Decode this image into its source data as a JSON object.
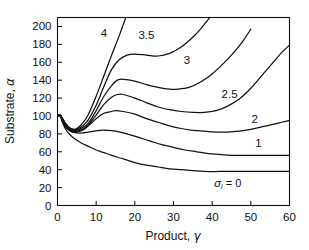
{
  "chart_data": {
    "type": "line",
    "title": "",
    "xlabel": "Product, γ",
    "ylabel": "Substrate, α",
    "xlim": [
      0,
      60
    ],
    "ylim": [
      0,
      210
    ],
    "xticks": [
      0,
      10,
      20,
      30,
      40,
      50,
      60
    ],
    "yticks": [
      0,
      20,
      40,
      60,
      80,
      100,
      120,
      140,
      160,
      180,
      200
    ],
    "grid": false,
    "legend": "inline-curve-labels",
    "annotations": [
      {
        "text": "σᵢ = 0",
        "x": 44,
        "y": 25,
        "note": "label for lowest curve"
      }
    ],
    "series": [
      {
        "name": "4",
        "label": "4",
        "label_x": 12,
        "label_y": 193,
        "points": [
          [
            0,
            100
          ],
          [
            0.6,
            101
          ],
          [
            1.2,
            98
          ],
          [
            2,
            92
          ],
          [
            3,
            87
          ],
          [
            4,
            85
          ],
          [
            5,
            86
          ],
          [
            6.5,
            92
          ],
          [
            8,
            102
          ],
          [
            10,
            122
          ],
          [
            12,
            145
          ],
          [
            14,
            168
          ],
          [
            16,
            190
          ],
          [
            17.5,
            208
          ],
          [
            18,
            212
          ]
        ]
      },
      {
        "name": "3.5",
        "label": "3.5",
        "label_x": 23,
        "label_y": 190,
        "points": [
          [
            0,
            100
          ],
          [
            0.6,
            101
          ],
          [
            1.2,
            98
          ],
          [
            2,
            92
          ],
          [
            3,
            87
          ],
          [
            4,
            85
          ],
          [
            5,
            85
          ],
          [
            6.5,
            89
          ],
          [
            8,
            96
          ],
          [
            10,
            112
          ],
          [
            12,
            133
          ],
          [
            14,
            152
          ],
          [
            16,
            163
          ],
          [
            18,
            168
          ],
          [
            20,
            169
          ],
          [
            23,
            168
          ],
          [
            26,
            167
          ],
          [
            29,
            170
          ],
          [
            32,
            177
          ],
          [
            35,
            188
          ],
          [
            37,
            197
          ],
          [
            39,
            208
          ],
          [
            39.8,
            212
          ]
        ]
      },
      {
        "name": "3",
        "label": "3",
        "label_x": 33.5,
        "label_y": 163,
        "points": [
          [
            0,
            100
          ],
          [
            0.6,
            101
          ],
          [
            1.2,
            97
          ],
          [
            2,
            91
          ],
          [
            3,
            86
          ],
          [
            4,
            84
          ],
          [
            5,
            84
          ],
          [
            6.5,
            87
          ],
          [
            8,
            92
          ],
          [
            10,
            106
          ],
          [
            12,
            122
          ],
          [
            14,
            134
          ],
          [
            15.5,
            140
          ],
          [
            17,
            141
          ],
          [
            20,
            139
          ],
          [
            23,
            135
          ],
          [
            26,
            132
          ],
          [
            29,
            130
          ],
          [
            31,
            130
          ],
          [
            34,
            132
          ],
          [
            37,
            138
          ],
          [
            40,
            147
          ],
          [
            43,
            159
          ],
          [
            46,
            173
          ],
          [
            48,
            184
          ],
          [
            50,
            197
          ]
        ]
      },
      {
        "name": "2.5",
        "label": "2.5",
        "label_x": 44.5,
        "label_y": 124,
        "points": [
          [
            0,
            100
          ],
          [
            0.6,
            101
          ],
          [
            1.2,
            97
          ],
          [
            2,
            90
          ],
          [
            3,
            85
          ],
          [
            4,
            83
          ],
          [
            5,
            83
          ],
          [
            6.5,
            85
          ],
          [
            8,
            90
          ],
          [
            10,
            101
          ],
          [
            12,
            113
          ],
          [
            14,
            121
          ],
          [
            15.5,
            124
          ],
          [
            17,
            124
          ],
          [
            20,
            120
          ],
          [
            23,
            115
          ],
          [
            26,
            110
          ],
          [
            29,
            107
          ],
          [
            32,
            105
          ],
          [
            35,
            104
          ],
          [
            38,
            104
          ],
          [
            41,
            106
          ],
          [
            44,
            111
          ],
          [
            47,
            119
          ],
          [
            50,
            131
          ],
          [
            53,
            146
          ],
          [
            56,
            161
          ],
          [
            58,
            171
          ],
          [
            60,
            179
          ]
        ]
      },
      {
        "name": "2",
        "label": "2",
        "label_x": 51,
        "label_y": 97,
        "points": [
          [
            0,
            100
          ],
          [
            0.6,
            101
          ],
          [
            1.2,
            96
          ],
          [
            2,
            89
          ],
          [
            3,
            84
          ],
          [
            4,
            82
          ],
          [
            5,
            82
          ],
          [
            6.5,
            84
          ],
          [
            8,
            89
          ],
          [
            10,
            97
          ],
          [
            12,
            103
          ],
          [
            14,
            105
          ],
          [
            15,
            106
          ],
          [
            17,
            105
          ],
          [
            20,
            102
          ],
          [
            23,
            97
          ],
          [
            26,
            93
          ],
          [
            29,
            89
          ],
          [
            32,
            86
          ],
          [
            35,
            84
          ],
          [
            38,
            83
          ],
          [
            41,
            82
          ],
          [
            44,
            82
          ],
          [
            47,
            83
          ],
          [
            50,
            85
          ],
          [
            53,
            88
          ],
          [
            56,
            91
          ],
          [
            58,
            93
          ],
          [
            60,
            95
          ]
        ]
      },
      {
        "name": "1",
        "label": "1",
        "label_x": 52,
        "label_y": 70,
        "points": [
          [
            0,
            100
          ],
          [
            0.6,
            101
          ],
          [
            1.2,
            95
          ],
          [
            2,
            88
          ],
          [
            3,
            84
          ],
          [
            4,
            82
          ],
          [
            5,
            81
          ],
          [
            6.5,
            81
          ],
          [
            8,
            82
          ],
          [
            9.5,
            83
          ],
          [
            11,
            84
          ],
          [
            13,
            84
          ],
          [
            15,
            83
          ],
          [
            18,
            80
          ],
          [
            21,
            76
          ],
          [
            24,
            72
          ],
          [
            27,
            68
          ],
          [
            30,
            65
          ],
          [
            33,
            62
          ],
          [
            36,
            60
          ],
          [
            39,
            58
          ],
          [
            42,
            57
          ],
          [
            45,
            56
          ],
          [
            48,
            56
          ],
          [
            51,
            56
          ],
          [
            54,
            56
          ],
          [
            57,
            56
          ],
          [
            60,
            56
          ]
        ]
      },
      {
        "name": "0",
        "label": "",
        "label_x": 0,
        "label_y": 0,
        "points": [
          [
            0,
            100
          ],
          [
            0.6,
            101
          ],
          [
            1.2,
            94
          ],
          [
            2,
            86
          ],
          [
            3,
            80
          ],
          [
            4,
            76
          ],
          [
            5,
            73
          ],
          [
            6.5,
            69
          ],
          [
            8,
            66
          ],
          [
            10,
            62
          ],
          [
            12,
            59
          ],
          [
            14,
            56
          ],
          [
            17,
            52
          ],
          [
            20,
            48
          ],
          [
            23,
            45
          ],
          [
            26,
            43
          ],
          [
            29,
            41
          ],
          [
            32,
            40
          ],
          [
            35,
            39
          ],
          [
            38,
            38
          ],
          [
            42,
            38
          ],
          [
            46,
            38
          ],
          [
            50,
            38
          ],
          [
            54,
            38
          ],
          [
            57,
            38
          ],
          [
            60,
            38
          ]
        ]
      }
    ]
  }
}
